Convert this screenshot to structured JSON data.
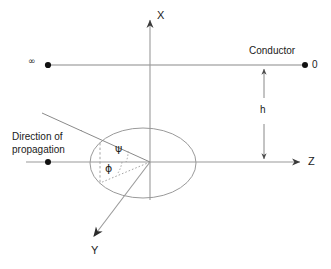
{
  "diagram": {
    "stroke_color": "#808080",
    "dark_stroke_color": "#4d4d4d",
    "text_color": "#1a1a1a",
    "background": "#ffffff",
    "axes": [
      {
        "name": "x-axis",
        "label": "X",
        "direction": "up",
        "origin": [
          150,
          162
        ],
        "tip": [
          150,
          18
        ]
      },
      {
        "name": "z-axis",
        "label": "Z",
        "direction": "right",
        "origin": [
          150,
          162
        ],
        "tip": [
          302,
          162
        ]
      },
      {
        "name": "y-axis",
        "label": "Y",
        "direction": "down-left",
        "origin": [
          150,
          162
        ],
        "tip": [
          92,
          238
        ]
      }
    ],
    "conductor": {
      "label": "Conductor",
      "left_marker_label": "∞",
      "right_marker_label": "0",
      "line_y": 65,
      "line_x_start": 48,
      "line_x_end": 305
    },
    "height_dimension": {
      "label": "h",
      "x": 264,
      "y_top": 68,
      "y_bottom": 160
    },
    "propagation": {
      "label_line_1": "Direction of",
      "label_line_2": "propagation",
      "ray_start": [
        42,
        113
      ],
      "ray_end": [
        150,
        162
      ],
      "marker": [
        48,
        162
      ]
    },
    "angles": [
      {
        "name": "psi",
        "label": "ψ",
        "position": [
          118,
          149
        ]
      },
      {
        "name": "phi",
        "label": "ϕ",
        "position": [
          108,
          165
        ]
      }
    ],
    "ellipse": {
      "name": "reference-circle",
      "center": [
        143,
        163
      ],
      "rx": 53,
      "ry": 35
    }
  }
}
